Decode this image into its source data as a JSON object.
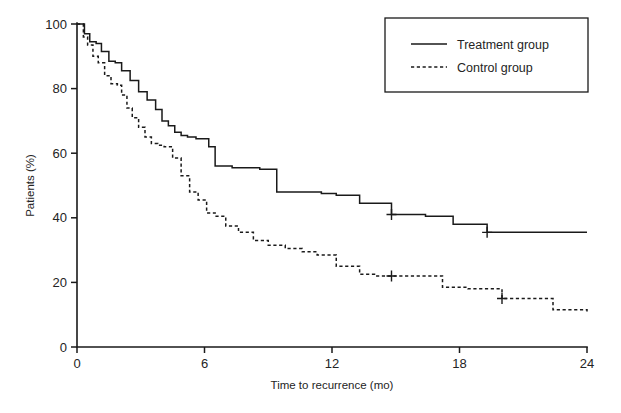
{
  "chart_data": {
    "type": "line",
    "title": "",
    "xlabel": "Time to recurrence (mo)",
    "ylabel": "Patients (%)",
    "xlim": [
      0,
      24
    ],
    "ylim": [
      0,
      100
    ],
    "xticks": [
      0,
      6,
      12,
      18,
      24
    ],
    "yticks": [
      0,
      20,
      40,
      60,
      80,
      100
    ],
    "xtick_labels": [
      "0",
      "6",
      "12",
      "18",
      "24"
    ],
    "ytick_labels": [
      "0",
      "20",
      "40",
      "60",
      "80",
      "100"
    ],
    "grid": false,
    "legend_position": "top-right",
    "step_style": "post",
    "series": [
      {
        "name": "Treatment group",
        "style": "solid",
        "color": "#1a1a1a",
        "x": [
          0.0,
          0.35,
          0.6,
          0.9,
          1.15,
          1.5,
          1.8,
          2.1,
          2.5,
          2.9,
          3.3,
          3.7,
          4.0,
          4.3,
          4.6,
          4.9,
          5.2,
          5.6,
          6.2,
          6.5,
          7.3,
          8.6,
          9.4,
          11.5,
          12.2,
          13.3,
          14.8,
          16.4,
          17.7,
          19.3,
          24.0
        ],
        "y": [
          100,
          97,
          94.5,
          94,
          91.5,
          88.5,
          88,
          85.5,
          82.5,
          79,
          76.5,
          73.5,
          70,
          68.5,
          66.5,
          65.5,
          65,
          64.5,
          62,
          56,
          55.5,
          55,
          48,
          47.5,
          47,
          44.5,
          41,
          40.5,
          38,
          35.5,
          35.5
        ],
        "censored": [
          {
            "x": 14.8,
            "y": 41
          },
          {
            "x": 19.3,
            "y": 35.5
          }
        ]
      },
      {
        "name": "Control group",
        "style": "dashed",
        "color": "#1a1a1a",
        "x": [
          0.0,
          0.3,
          0.5,
          0.75,
          1.0,
          1.3,
          1.6,
          1.9,
          2.1,
          2.35,
          2.6,
          2.9,
          3.2,
          3.5,
          3.8,
          4.1,
          4.5,
          4.9,
          5.3,
          5.7,
          6.1,
          6.5,
          7.0,
          7.6,
          8.3,
          9.0,
          9.8,
          10.6,
          11.3,
          12.2,
          13.3,
          14.0,
          14.8,
          17.2,
          18.4,
          20.0,
          21.6,
          22.4,
          24.0
        ],
        "y": [
          100,
          96,
          93.5,
          90,
          88,
          84,
          81.5,
          81,
          78,
          74,
          71,
          68,
          65,
          63,
          62.5,
          62,
          58.5,
          53,
          48,
          45.5,
          41.5,
          40.5,
          37.5,
          35.5,
          33,
          31.5,
          30.5,
          29.5,
          28.5,
          25,
          22.5,
          22,
          22,
          18.5,
          18,
          15,
          15,
          11.5,
          11
        ],
        "censored": [
          {
            "x": 14.8,
            "y": 22
          },
          {
            "x": 20.0,
            "y": 15
          }
        ]
      }
    ],
    "legend": [
      {
        "label": "Treatment group",
        "style": "solid"
      },
      {
        "label": "Control group",
        "style": "dashed"
      }
    ]
  }
}
